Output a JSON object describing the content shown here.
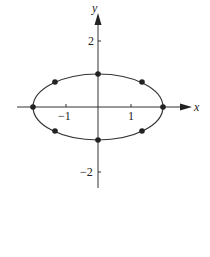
{
  "figure": {
    "x_axis_label": "x",
    "y_axis_label": "y",
    "x_tick_labels": [
      "−1",
      "1"
    ],
    "y_tick_labels": [
      "2",
      "−2"
    ],
    "curve": {
      "type": "ellipse",
      "center": [
        0,
        0
      ],
      "a": 2,
      "b": 1
    },
    "points": [
      {
        "x": -2,
        "y": 0
      },
      {
        "x": 2,
        "y": 0
      },
      {
        "x": 0,
        "y": 1
      },
      {
        "x": 0,
        "y": -1
      },
      {
        "x": -1.414,
        "y": 0.707
      },
      {
        "x": 1.414,
        "y": 0.707
      },
      {
        "x": -1.414,
        "y": -0.707
      },
      {
        "x": 1.414,
        "y": -0.707
      }
    ],
    "colors": {
      "ink": "#222222",
      "background": "#ffffff"
    }
  }
}
